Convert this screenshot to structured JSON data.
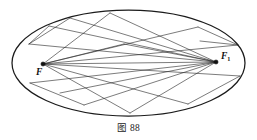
{
  "figure": {
    "caption": "图 88",
    "caption_label": "图",
    "caption_number": "88",
    "background_color": "#ffffff",
    "line_color": "#2a2a2a",
    "outline_color": "#1b1b1b"
  },
  "geometry": {
    "type": "ellipse-with-focal-chords",
    "ellipse": {
      "center_x": 128.5,
      "center_y": 63,
      "radius_x": 116.5,
      "radius_y": 53
    },
    "foci": [
      {
        "id": "F",
        "label": "F",
        "subscript": "",
        "x": 43,
        "y": 64,
        "label_x": 36,
        "label_y": 75
      },
      {
        "id": "F1",
        "label": "F",
        "subscript": "1",
        "x": 216,
        "y": 62,
        "label_x": 221,
        "label_y": 59
      }
    ],
    "vertices": [
      {
        "id": "P1",
        "x": 110,
        "y": 13
      },
      {
        "id": "P2",
        "x": 49,
        "y": 26
      },
      {
        "id": "P3",
        "x": 198,
        "y": 27
      },
      {
        "id": "P4",
        "x": 29,
        "y": 44
      },
      {
        "id": "P5",
        "x": 238,
        "y": 45
      },
      {
        "id": "P6",
        "x": 124,
        "y": 44
      },
      {
        "id": "P7",
        "x": 200,
        "y": 41
      },
      {
        "id": "P8",
        "x": 30,
        "y": 83
      },
      {
        "id": "P9",
        "x": 240,
        "y": 76
      },
      {
        "id": "P10",
        "x": 130,
        "y": 113
      },
      {
        "id": "P11",
        "x": 84,
        "y": 105
      },
      {
        "id": "P12",
        "x": 188,
        "y": 104
      },
      {
        "id": "P13",
        "x": 70,
        "y": 18
      },
      {
        "id": "P14",
        "x": 60,
        "y": 93
      }
    ],
    "chords": [
      {
        "from": "P2",
        "to": "F1",
        "note": "focal chord"
      },
      {
        "from": "P1",
        "to": "F",
        "note": "focal chord"
      },
      {
        "from": "P1",
        "to": "F1",
        "note": "focal chord"
      },
      {
        "from": "P3",
        "to": "F",
        "note": "focal chord"
      },
      {
        "from": "P4",
        "to": "F1",
        "note": "focal chord"
      },
      {
        "from": "P5",
        "to": "F",
        "note": "focal chord"
      },
      {
        "from": "P6",
        "to": "F",
        "note": "focal chord"
      },
      {
        "from": "P6",
        "to": "F1",
        "note": "focal chord"
      },
      {
        "from": "P8",
        "to": "F1",
        "note": "focal chord"
      },
      {
        "from": "P9",
        "to": "F",
        "note": "focal chord"
      },
      {
        "from": "P10",
        "to": "F",
        "note": "focal chord"
      },
      {
        "from": "P10",
        "to": "F1",
        "note": "focal chord"
      },
      {
        "from": "P11",
        "to": "F1",
        "note": "focal chord"
      },
      {
        "from": "P12",
        "to": "F",
        "note": "focal chord"
      },
      {
        "from": "P13",
        "to": "F1",
        "note": "focal chord"
      },
      {
        "from": "P14",
        "to": "F1",
        "note": "focal chord"
      },
      {
        "from": "F",
        "to": "F1",
        "note": "major axis segment"
      },
      {
        "from": "P2",
        "to": "P4",
        "note": "edge"
      },
      {
        "from": "P13",
        "to": "P4",
        "note": "edge"
      },
      {
        "from": "P3",
        "to": "P5",
        "note": "edge"
      },
      {
        "from": "P7",
        "to": "P5",
        "note": "edge"
      },
      {
        "from": "P8",
        "to": "P11",
        "note": "edge"
      },
      {
        "from": "P9",
        "to": "P12",
        "note": "edge"
      }
    ]
  }
}
